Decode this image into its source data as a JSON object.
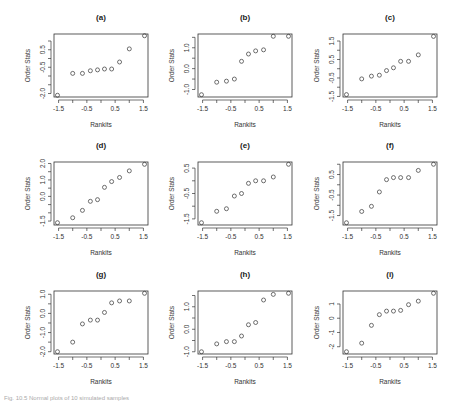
{
  "figure": {
    "caption": "Fig. 10.5 Normal plots of 10 simulated samples"
  },
  "chart_data": [
    {
      "id": "a",
      "type": "scatter",
      "title": "(a)",
      "xlabel": "Rankits",
      "ylabel": "Order Stats",
      "x": [
        -1.539,
        -1.001,
        -0.656,
        -0.376,
        -0.123,
        0.123,
        0.376,
        0.656,
        1.001,
        1.539
      ],
      "y": [
        -2.1,
        -0.85,
        -0.85,
        -0.7,
        -0.65,
        -0.6,
        -0.6,
        -0.2,
        0.55,
        1.3
      ],
      "xticks": [
        -1.5,
        -0.5,
        0.5,
        1.5
      ],
      "xtick_labels": [
        "-1.5",
        "-0.5",
        "0.5",
        "1.5"
      ],
      "yticks": [
        -2.0,
        -1.5,
        -1.0,
        -0.5,
        0.0,
        0.5,
        1.0
      ],
      "ytick_labels": [
        "-2.0",
        "",
        "",
        "-0.5",
        "",
        "0.5",
        ""
      ],
      "xlim": [
        -1.662,
        1.662
      ],
      "ylim": [
        -2.2,
        1.4
      ]
    },
    {
      "id": "b",
      "type": "scatter",
      "title": "(b)",
      "xlabel": "Rankits",
      "ylabel": "Order Stats",
      "x": [
        -1.539,
        -1.001,
        -0.656,
        -0.376,
        -0.123,
        0.123,
        0.376,
        0.656,
        1.001,
        1.539
      ],
      "y": [
        -1.25,
        -0.65,
        -0.6,
        -0.5,
        0.35,
        0.7,
        0.85,
        0.9,
        1.55,
        1.55
      ],
      "xticks": [
        -1.5,
        -0.5,
        0.5,
        1.5
      ],
      "xtick_labels": [
        "-1.5",
        "-0.5",
        "0.5",
        "1.5"
      ],
      "yticks": [
        -1.0,
        -0.5,
        0.0,
        0.5,
        1.0,
        1.5
      ],
      "ytick_labels": [
        "-1.0",
        "",
        "0.0",
        "",
        "1.0",
        ""
      ],
      "xlim": [
        -1.662,
        1.662
      ],
      "ylim": [
        -1.36,
        1.66
      ]
    },
    {
      "id": "c",
      "type": "scatter",
      "title": "(c)",
      "xlabel": "Rankits",
      "ylabel": "Order Stats",
      "x": [
        -1.539,
        -1.001,
        -0.656,
        -0.376,
        -0.123,
        0.123,
        0.376,
        0.656,
        1.001,
        1.539
      ],
      "y": [
        -1.4,
        -0.55,
        -0.4,
        -0.35,
        -0.1,
        0.05,
        0.4,
        0.4,
        0.75,
        1.75
      ],
      "xticks": [
        -1.5,
        -0.5,
        0.5,
        1.5
      ],
      "xtick_labels": [
        "-1.5",
        "-0.5",
        "0.5",
        "1.5"
      ],
      "yticks": [
        -1.5,
        -1.0,
        -0.5,
        0.0,
        0.5,
        1.0,
        1.5
      ],
      "ytick_labels": [
        "-1.5",
        "",
        "-0.5",
        "",
        "0.5",
        "",
        "1.5"
      ],
      "xlim": [
        -1.662,
        1.662
      ],
      "ylim": [
        -1.53,
        1.88
      ]
    },
    {
      "id": "d",
      "type": "scatter",
      "title": "(d)",
      "xlabel": "Rankits",
      "ylabel": "Order Stats",
      "x": [
        -1.539,
        -1.001,
        -0.656,
        -0.376,
        -0.123,
        0.123,
        0.376,
        0.656,
        1.001,
        1.539
      ],
      "y": [
        -1.6,
        -1.3,
        -0.85,
        -0.3,
        -0.2,
        0.55,
        0.9,
        1.15,
        1.55,
        1.95
      ],
      "xticks": [
        -1.5,
        -0.5,
        0.5,
        1.5
      ],
      "xtick_labels": [
        "-1.5",
        "-0.5",
        "0.5",
        "1.5"
      ],
      "yticks": [
        -1.5,
        -1.0,
        -0.5,
        0.0,
        0.5,
        1.0,
        1.5,
        2.0
      ],
      "ytick_labels": [
        "-1.5",
        "",
        "",
        "0.0",
        "",
        "1.0",
        "",
        "2.0"
      ],
      "xlim": [
        -1.662,
        1.662
      ],
      "ylim": [
        -1.74,
        2.09
      ]
    },
    {
      "id": "e",
      "type": "scatter",
      "title": "(e)",
      "xlabel": "Rankits",
      "ylabel": "Order Stats",
      "x": [
        -1.539,
        -1.001,
        -0.656,
        -0.376,
        -0.123,
        0.123,
        0.376,
        0.656,
        1.001,
        1.539
      ],
      "y": [
        -1.65,
        -1.2,
        -1.1,
        -0.6,
        -0.5,
        -0.1,
        0.0,
        0.0,
        0.15,
        0.65
      ],
      "xticks": [
        -1.5,
        -0.5,
        0.5,
        1.5
      ],
      "xtick_labels": [
        "-1.5",
        "-0.5",
        "0.5",
        "1.5"
      ],
      "yticks": [
        -1.5,
        -1.0,
        -0.5,
        0.0,
        0.5
      ],
      "ytick_labels": [
        "-1.5",
        "",
        "-0.5",
        "",
        "0.5"
      ],
      "xlim": [
        -1.662,
        1.662
      ],
      "ylim": [
        -1.74,
        0.74
      ]
    },
    {
      "id": "f",
      "type": "scatter",
      "title": "(f)",
      "xlabel": "Rankits",
      "ylabel": "Order Stats",
      "x": [
        -1.539,
        -1.001,
        -0.656,
        -0.376,
        -0.123,
        0.123,
        0.376,
        0.656,
        1.001,
        1.539
      ],
      "y": [
        -1.85,
        -1.3,
        -1.05,
        -0.35,
        0.25,
        0.35,
        0.35,
        0.35,
        0.7,
        1.0
      ],
      "xticks": [
        -1.5,
        -0.5,
        0.5,
        1.5
      ],
      "xtick_labels": [
        "-1.5",
        "-0.5",
        "0.5",
        "1.5"
      ],
      "yticks": [
        -1.5,
        -1.0,
        -0.5,
        0.0,
        0.5,
        1.0
      ],
      "ytick_labels": [
        "-1.5",
        "",
        "-0.5",
        "",
        "0.5",
        ""
      ],
      "xlim": [
        -1.662,
        1.662
      ],
      "ylim": [
        -1.96,
        1.11
      ]
    },
    {
      "id": "g",
      "type": "scatter",
      "title": "(g)",
      "xlabel": "Rankits",
      "ylabel": "Order Stats",
      "x": [
        -1.539,
        -1.001,
        -0.656,
        -0.376,
        -0.123,
        0.123,
        0.376,
        0.656,
        1.001,
        1.539
      ],
      "y": [
        -2.0,
        -1.5,
        -0.55,
        -0.35,
        -0.35,
        0.05,
        0.55,
        0.65,
        0.65,
        1.05
      ],
      "xticks": [
        -1.5,
        -0.5,
        0.5,
        1.5
      ],
      "xtick_labels": [
        "-1.5",
        "-0.5",
        "0.5",
        "1.5"
      ],
      "yticks": [
        -2.0,
        -1.5,
        -1.0,
        -0.5,
        0.0,
        0.5,
        1.0
      ],
      "ytick_labels": [
        "-2.0",
        "",
        "-1.0",
        "",
        "0.0",
        "",
        "1.0"
      ],
      "xlim": [
        -1.662,
        1.662
      ],
      "ylim": [
        -2.12,
        1.17
      ]
    },
    {
      "id": "h",
      "type": "scatter",
      "title": "(h)",
      "xlabel": "Rankits",
      "ylabel": "Order Stats",
      "x": [
        -1.539,
        -1.001,
        -0.656,
        -0.376,
        -0.123,
        0.123,
        0.376,
        0.656,
        1.001,
        1.539
      ],
      "y": [
        -1.0,
        -0.65,
        -0.55,
        -0.55,
        -0.3,
        0.2,
        0.3,
        1.3,
        1.55,
        1.6
      ],
      "xticks": [
        -1.5,
        -0.5,
        0.5,
        1.5
      ],
      "xtick_labels": [
        "-1.5",
        "-0.5",
        "0.5",
        "1.5"
      ],
      "yticks": [
        -1.0,
        -0.5,
        0.0,
        0.5,
        1.0,
        1.5
      ],
      "ytick_labels": [
        "-1.0",
        "",
        "0.0",
        "",
        "1.0",
        ""
      ],
      "xlim": [
        -1.662,
        1.662
      ],
      "ylim": [
        -1.1,
        1.7
      ]
    },
    {
      "id": "i",
      "type": "scatter",
      "title": "(i)",
      "xlabel": "Rankits",
      "ylabel": "Order Stats",
      "x": [
        -1.539,
        -1.001,
        -0.656,
        -0.376,
        -0.123,
        0.123,
        0.376,
        0.656,
        1.001,
        1.539
      ],
      "y": [
        -2.35,
        -1.75,
        -0.5,
        0.25,
        0.5,
        0.5,
        0.55,
        0.95,
        1.2,
        1.75
      ],
      "xticks": [
        -1.5,
        -0.5,
        0.5,
        1.5
      ],
      "xtick_labels": [
        "-1.5",
        "-0.5",
        "0.5",
        "1.5"
      ],
      "yticks": [
        -2,
        -1,
        0,
        1
      ],
      "ytick_labels": [
        "-2",
        "-1",
        "0",
        "1"
      ],
      "xlim": [
        -1.662,
        1.662
      ],
      "ylim": [
        -2.51,
        1.91
      ]
    }
  ]
}
